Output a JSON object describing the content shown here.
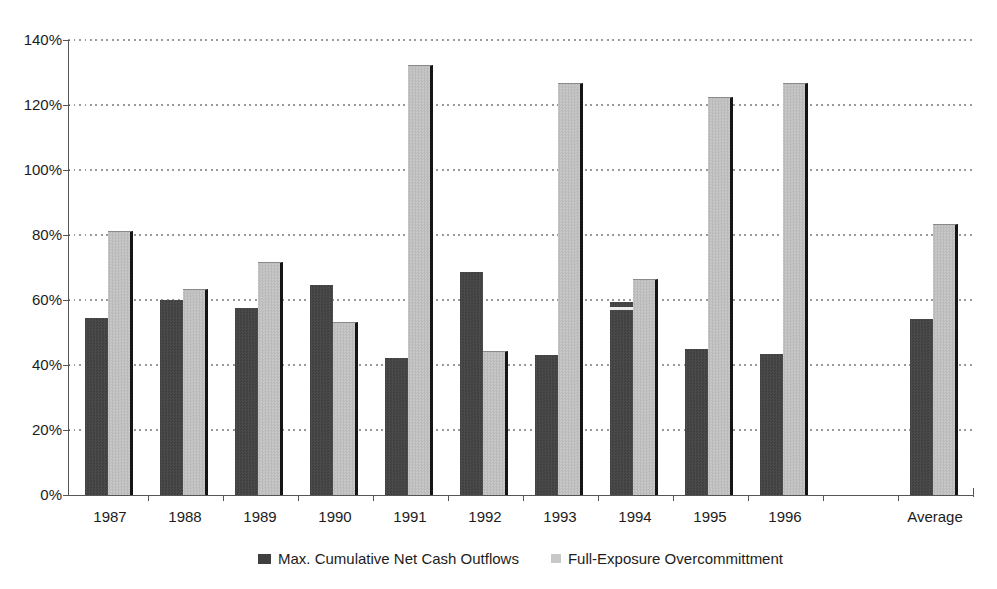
{
  "chart_data": {
    "type": "bar",
    "title": "",
    "xlabel": "",
    "ylabel": "",
    "categories": [
      "1987",
      "1988",
      "1989",
      "1990",
      "1991",
      "1992",
      "1993",
      "1994",
      "1995",
      "1996",
      "Average"
    ],
    "category_slots": [
      0,
      1,
      2,
      3,
      4,
      5,
      6,
      7,
      8,
      9,
      11
    ],
    "series": [
      {
        "name": "Max. Cumulative Net Cash Outflows",
        "color": "#3f3f3f",
        "color_alt": "#4b4b4b",
        "values": [
          54.5,
          60,
          57.5,
          64.5,
          42,
          68.5,
          43,
          59.5,
          45,
          43.5,
          54
        ]
      },
      {
        "name": "Full-Exposure Overcommittment",
        "color": "#c8c8c8",
        "color_alt": "#bababa",
        "values": [
          81,
          63,
          71.5,
          53,
          132,
          44,
          126.5,
          66,
          122,
          126.5,
          83
        ]
      }
    ],
    "y_axis": {
      "min": 0,
      "max": 140,
      "step": 20,
      "tick_suffix": "%"
    },
    "y_tick_labels": [
      "0%",
      "20%",
      "40%",
      "60%",
      "80%",
      "100%",
      "120%",
      "140%"
    ],
    "grid": "dotted-horizontal",
    "legend_position": "bottom-center",
    "bar_shadow_color": "#151515",
    "axis_color": "#555555",
    "grid_color": "#9a9a9a",
    "text_color": "#1c1c1c",
    "background_color": "#ffffff",
    "artifacts": [
      {
        "category": "1994",
        "series_index": 0,
        "type": "white-stripe",
        "offset_from_top_px": 5,
        "height_px": 3,
        "color": "#ffffff"
      }
    ]
  }
}
